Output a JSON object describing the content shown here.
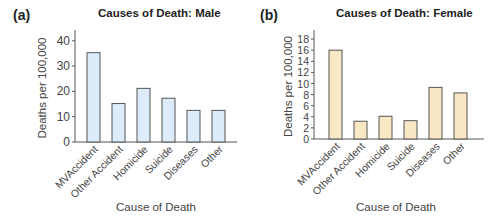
{
  "panels": [
    {
      "label": "(a)",
      "title": "Causes of Death: Male"
    },
    {
      "label": "(b)",
      "title": "Causes of Death: Female"
    }
  ],
  "colors": {
    "male_bar": "#dcecfa",
    "female_bar": "#f8e8c4",
    "bar_stroke": "#555555",
    "axis": "#555555"
  },
  "chart_data": [
    {
      "type": "bar",
      "title": "Causes of Death: Male",
      "panel_label": "(a)",
      "xlabel": "Cause of Death",
      "ylabel": "Deaths per 100,000",
      "categories": [
        "MVAccident",
        "Other Accident",
        "Homicide",
        "Suicide",
        "Diseases",
        "Other"
      ],
      "values": [
        35.3,
        15.2,
        21.2,
        17.3,
        12.5,
        12.5
      ],
      "ylim": [
        0,
        45
      ],
      "yticks": [
        0,
        10,
        20,
        30,
        40
      ],
      "grid": false,
      "legend": null
    },
    {
      "type": "bar",
      "title": "Causes of Death: Female",
      "panel_label": "(b)",
      "xlabel": "Cause of Death",
      "ylabel": "Deaths per 100,000",
      "categories": [
        "MVAccident",
        "Other Accident",
        "Homicide",
        "Suicide",
        "Diseases",
        "Other"
      ],
      "values": [
        16.0,
        3.2,
        4.1,
        3.3,
        9.3,
        8.3
      ],
      "ylim": [
        0,
        20
      ],
      "yticks": [
        0,
        2,
        4,
        6,
        8,
        10,
        12,
        14,
        16,
        18
      ],
      "grid": false,
      "legend": null
    }
  ]
}
